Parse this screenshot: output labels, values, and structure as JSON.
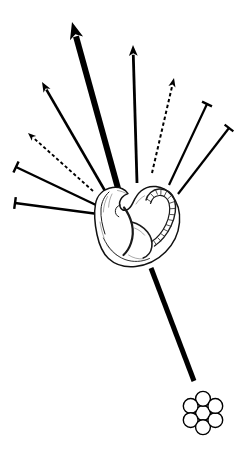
{
  "figure": {
    "background_color": "#ffffff",
    "ink_color": "#000000",
    "width": 250,
    "height": 452
  },
  "embryo": {
    "label": "embryo",
    "outline_color": "#111111",
    "fill_color": "#ffffff",
    "center_x": 137,
    "center_y": 224,
    "somite_count": 14
  },
  "cell_cluster": {
    "label": "cell cluster",
    "cell_count": 7,
    "arrangement": "hexagonal",
    "cell_radius": 7.4,
    "center_x": 203,
    "center_y": 413,
    "stroke_color": "#000000",
    "fill_color": "#ffffff"
  },
  "connectors": [
    {
      "id": "c1",
      "name": "thick-solid-arrow-up-left",
      "kind": "arrow",
      "style": "solid",
      "weight": 6.0,
      "x1": 119,
      "y1": 192,
      "x2": 72,
      "y2": 22,
      "head": "arrowhead",
      "head_size": 17
    },
    {
      "id": "c2",
      "name": "solid-arrow-up-left-steep",
      "kind": "arrow",
      "style": "solid",
      "weight": 2.6,
      "x1": 108,
      "y1": 196,
      "x2": 42,
      "y2": 82,
      "head": "arrowhead",
      "head_size": 10
    },
    {
      "id": "c3",
      "name": "dashed-arrow-up-left",
      "kind": "arrow",
      "style": "dashed",
      "weight": 1.9,
      "x1": 93,
      "y1": 191,
      "x2": 28,
      "y2": 133,
      "head": "arrowhead",
      "head_size": 8
    },
    {
      "id": "c4",
      "name": "tbar-left-upper",
      "kind": "inhibitor",
      "style": "solid",
      "weight": 2.3,
      "x1": 96,
      "y1": 205,
      "x2": 16,
      "y2": 167,
      "head": "t-bar",
      "head_size": 12
    },
    {
      "id": "c5",
      "name": "tbar-left-lower",
      "kind": "inhibitor",
      "style": "solid",
      "weight": 2.3,
      "x1": 98,
      "y1": 214,
      "x2": 15,
      "y2": 203,
      "head": "t-bar",
      "head_size": 12
    },
    {
      "id": "c6",
      "name": "solid-arrow-up-vertical",
      "kind": "arrow",
      "style": "solid",
      "weight": 2.8,
      "x1": 137,
      "y1": 183,
      "x2": 133,
      "y2": 45,
      "head": "arrowhead",
      "head_size": 11
    },
    {
      "id": "c7",
      "name": "dashed-arrow-up-right",
      "kind": "arrow",
      "style": "dashed",
      "weight": 2.0,
      "x1": 152,
      "y1": 173,
      "x2": 174,
      "y2": 78,
      "head": "arrowhead",
      "head_size": 9
    },
    {
      "id": "c8",
      "name": "tbar-right-upper",
      "kind": "inhibitor",
      "style": "solid",
      "weight": 2.2,
      "x1": 169,
      "y1": 185,
      "x2": 207,
      "y2": 104,
      "head": "t-bar",
      "head_size": 11
    },
    {
      "id": "c9",
      "name": "tbar-right-lower",
      "kind": "inhibitor",
      "style": "solid",
      "weight": 2.2,
      "x1": 178,
      "y1": 194,
      "x2": 229,
      "y2": 128,
      "head": "t-bar",
      "head_size": 11
    },
    {
      "id": "c10",
      "name": "thick-line-to-cell-cluster",
      "kind": "line",
      "style": "solid",
      "weight": 5.0,
      "x1": 151,
      "y1": 268,
      "x2": 194,
      "y2": 381,
      "head": "none",
      "head_size": 0
    }
  ]
}
